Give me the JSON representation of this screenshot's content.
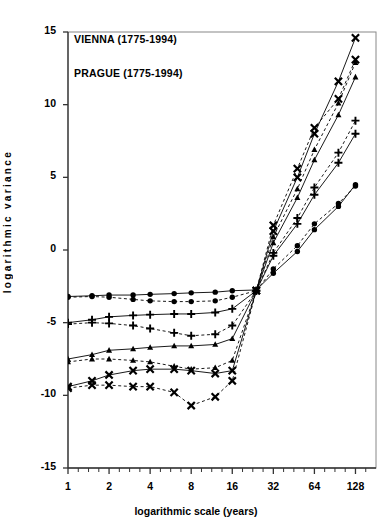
{
  "chart_data": {
    "type": "line",
    "title": "",
    "xlabel": "logarithmic scale (years)",
    "ylabel": "logarithmic variance",
    "x_ticklabels": [
      "1",
      "2",
      "4",
      "8",
      "16",
      "32",
      "64",
      "128"
    ],
    "x_tickvalues": [
      1,
      2,
      4,
      8,
      16,
      32,
      64,
      128
    ],
    "xlim": [
      1,
      181
    ],
    "xscale": "log2",
    "y_ticklabels": [
      "15",
      "10",
      "5",
      "0",
      "-5",
      "-10",
      "-15"
    ],
    "y_tickvalues": [
      15,
      10,
      5,
      0,
      -5,
      -10,
      -15
    ],
    "ylim": [
      -15,
      15
    ],
    "grid": false,
    "legend_position": "upper-left",
    "annotations": [
      "VIENNA (1775-1994)",
      "PRAGUE (1775-1994)"
    ],
    "x": [
      1,
      1.5,
      2,
      3,
      4,
      6,
      8,
      12,
      16,
      24,
      32,
      48,
      64,
      96,
      128
    ],
    "series": [
      {
        "name": "Vienna series 1 (circles, solid)",
        "marker": "circle",
        "linestyle": "solid",
        "values": [
          -3.2,
          -3.15,
          -3.1,
          -3.1,
          -3.05,
          -3.0,
          -2.95,
          -2.9,
          -2.8,
          -2.75,
          -1.6,
          -0.1,
          1.4,
          3.0,
          4.5
        ]
      },
      {
        "name": "Prague series 1 (circles, dashed)",
        "marker": "circle",
        "linestyle": "dashed",
        "values": [
          -3.25,
          -3.2,
          -3.25,
          -3.4,
          -3.5,
          -3.55,
          -3.55,
          -3.5,
          -3.25,
          -2.8,
          -1.3,
          0.3,
          1.8,
          3.2,
          4.4
        ]
      },
      {
        "name": "Vienna series 2 (plus, solid)",
        "marker": "plus",
        "linestyle": "solid",
        "values": [
          -5.0,
          -4.8,
          -4.6,
          -4.5,
          -4.45,
          -4.4,
          -4.4,
          -4.3,
          -4.05,
          -2.8,
          -0.4,
          1.8,
          3.8,
          6.0,
          8.0
        ]
      },
      {
        "name": "Prague series 2 (plus, dashed)",
        "marker": "plus",
        "linestyle": "dashed",
        "values": [
          -5.1,
          -5.0,
          -5.05,
          -5.2,
          -5.4,
          -5.7,
          -5.9,
          -5.8,
          -5.2,
          -2.8,
          -0.2,
          2.2,
          4.3,
          6.7,
          8.9
        ]
      },
      {
        "name": "Vienna series 3 (triangles, solid)",
        "marker": "triangle",
        "linestyle": "solid",
        "values": [
          -7.5,
          -7.2,
          -6.9,
          -6.8,
          -6.7,
          -6.6,
          -6.6,
          -6.5,
          -6.1,
          -2.8,
          0.5,
          3.6,
          6.2,
          9.3,
          11.9
        ]
      },
      {
        "name": "Prague series 3 (triangles, dashed)",
        "marker": "triangle",
        "linestyle": "dashed",
        "values": [
          -7.7,
          -7.5,
          -7.5,
          -7.6,
          -7.7,
          -8.0,
          -8.2,
          -8.1,
          -7.6,
          -2.8,
          0.9,
          4.2,
          6.9,
          10.1,
          12.9
        ]
      },
      {
        "name": "Vienna series 4 (x-marks, solid)",
        "marker": "x",
        "linestyle": "solid",
        "values": [
          -9.4,
          -9.0,
          -8.6,
          -8.3,
          -8.2,
          -8.2,
          -8.3,
          -8.5,
          -8.3,
          -2.8,
          1.3,
          5.0,
          8.0,
          11.6,
          14.6
        ]
      },
      {
        "name": "Prague series 4 (x-marks, dashed)",
        "marker": "x",
        "linestyle": "dashed",
        "values": [
          -9.5,
          -9.3,
          -9.3,
          -9.4,
          -9.4,
          -9.8,
          -10.7,
          -10.1,
          -9.0,
          -2.8,
          1.7,
          5.6,
          8.4,
          10.4,
          13.1
        ]
      }
    ]
  }
}
